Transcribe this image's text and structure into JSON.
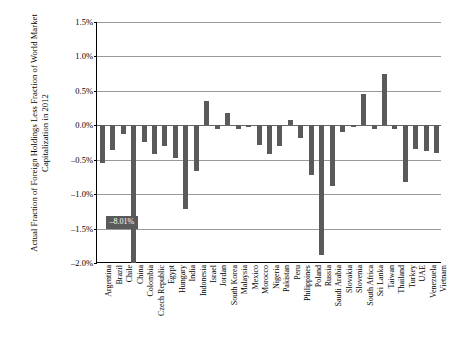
{
  "chart_data": {
    "type": "bar",
    "title": "",
    "xlabel": "",
    "ylabel": "Actual Fraction of Foreign Holdings Less Fraction of World Market Capitalization in 2012",
    "ylim": [
      -2.0,
      1.5
    ],
    "ytick_labels": [
      "1.5%",
      "1.0%",
      "0.5%",
      "0.0%",
      "-0.5%",
      "-1.0%",
      "-1.5%",
      "-2.0%"
    ],
    "ytick_values": [
      1.5,
      1.0,
      0.5,
      0.0,
      -0.5,
      -1.0,
      -1.5,
      -2.0
    ],
    "grid": true,
    "legend": "none",
    "units": "percent",
    "bar_color": "#5a5a5a",
    "categories": [
      "Argentina",
      "Brazil",
      "Chile",
      "China",
      "Colombia",
      "Czech Republic",
      "Egypt",
      "Hungary",
      "India",
      "Indonesia",
      "Israel",
      "Jordan",
      "South Korea",
      "Malaysia",
      "Mexico",
      "Morocco",
      "Nigeria",
      "Pakistan",
      "Peru",
      "Philippines",
      "Poland",
      "Russia",
      "Saudi Arabia",
      "Slovakia",
      "Slovenia",
      "South Africa",
      "Sri Lanka",
      "Taiwan",
      "Thailand",
      "Turkey",
      "UAE",
      "Venezuela",
      "Vietnam"
    ],
    "values": [
      -0.55,
      -0.36,
      -0.12,
      -8.01,
      -0.24,
      -0.42,
      -0.3,
      -0.48,
      -1.22,
      -0.66,
      0.35,
      -0.06,
      0.18,
      -0.05,
      -0.03,
      -0.28,
      -0.42,
      -0.3,
      0.07,
      -0.18,
      -0.72,
      -1.88,
      -0.88,
      -0.1,
      -0.02,
      0.45,
      -0.06,
      0.75,
      -0.05,
      -0.82,
      -0.35,
      -0.37,
      -0.4
    ],
    "annotations": [
      {
        "label": "-8.01%",
        "category": "China",
        "value": -8.01
      }
    ]
  }
}
